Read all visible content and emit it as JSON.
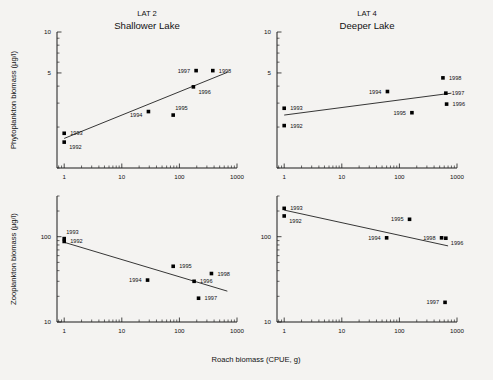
{
  "figure": {
    "background_color": "#f4f3f1",
    "ink_color": "#111111",
    "xlabel": "Roach biomass (CPUE, g)"
  },
  "chart_data": [
    {
      "type": "scatter",
      "panel_id": "top-left",
      "title": "LAT 2",
      "subtitle": "Shallower Lake",
      "xlabel": "Roach biomass (CPUE, g)",
      "ylabel": "Phytoplankton biomass (µg/l)",
      "xscale": "log",
      "yscale": "log",
      "xlim": [
        0.75,
        1000
      ],
      "ylim": [
        1.0,
        10
      ],
      "xticks": [
        1,
        10,
        100,
        1000
      ],
      "xticklabels": [
        "1",
        "10",
        "100",
        "1000"
      ],
      "yticks": [
        5,
        10
      ],
      "yticklabels": [
        "5",
        "10"
      ],
      "grid": false,
      "legend": "none",
      "points": [
        {
          "label": "1992",
          "x": 1.0,
          "y": 1.55,
          "label_pos": "below-right"
        },
        {
          "label": "1993",
          "x": 1.0,
          "y": 1.8,
          "label_pos": "right"
        },
        {
          "label": "1994",
          "x": 29,
          "y": 2.6,
          "label_pos": "left-below"
        },
        {
          "label": "1995",
          "x": 78,
          "y": 2.45,
          "label_pos": "above-right"
        },
        {
          "label": "1996",
          "x": 175,
          "y": 3.95,
          "label_pos": "below-right"
        },
        {
          "label": "1997",
          "x": 195,
          "y": 5.2,
          "label_pos": "left"
        },
        {
          "label": "1998",
          "x": 380,
          "y": 5.2,
          "label_pos": "right"
        }
      ],
      "trendline": {
        "x1": 1.0,
        "y1": 1.65,
        "x2": 680,
        "y2": 5.05,
        "slope_sign": "positive"
      }
    },
    {
      "type": "scatter",
      "panel_id": "top-right",
      "title": "LAT 4",
      "subtitle": "Deeper Lake",
      "xlabel": "Roach biomass (CPUE, g)",
      "ylabel": "Phytoplankton biomass (µg/l)",
      "xscale": "log",
      "yscale": "log",
      "xlim": [
        0.75,
        1000
      ],
      "ylim": [
        1.0,
        10
      ],
      "xticks": [
        1,
        10,
        100,
        1000
      ],
      "xticklabels": [
        "1",
        "10",
        "100",
        "1000"
      ],
      "yticks": [
        5,
        10
      ],
      "yticklabels": [
        "5",
        "10"
      ],
      "grid": false,
      "legend": "none",
      "points": [
        {
          "label": "1992",
          "x": 1.0,
          "y": 2.05,
          "label_pos": "right"
        },
        {
          "label": "1993",
          "x": 1.0,
          "y": 2.75,
          "label_pos": "right"
        },
        {
          "label": "1994",
          "x": 62,
          "y": 3.65,
          "label_pos": "left"
        },
        {
          "label": "1995",
          "x": 165,
          "y": 2.55,
          "label_pos": "left"
        },
        {
          "label": "1996",
          "x": 660,
          "y": 2.95,
          "label_pos": "right"
        },
        {
          "label": "1997",
          "x": 640,
          "y": 3.55,
          "label_pos": "right"
        },
        {
          "label": "1998",
          "x": 570,
          "y": 4.6,
          "label_pos": "right"
        }
      ],
      "trendline": {
        "x1": 1.0,
        "y1": 2.45,
        "x2": 800,
        "y2": 3.55,
        "slope_sign": "positive"
      }
    },
    {
      "type": "scatter",
      "panel_id": "bottom-left",
      "title": "LAT 2",
      "subtitle": "Shallower Lake",
      "xlabel": "Roach biomass (CPUE, g)",
      "ylabel": "Zooplankton biomass  (µg/l)",
      "xscale": "log",
      "yscale": "log",
      "xlim": [
        0.75,
        1000
      ],
      "ylim": [
        10,
        300
      ],
      "xticks": [
        1,
        10,
        100,
        1000
      ],
      "xticklabels": [
        "1",
        "10",
        "100",
        "1000"
      ],
      "yticks": [
        10,
        100
      ],
      "yticklabels": [
        "10",
        "100"
      ],
      "grid": false,
      "legend": "none",
      "points": [
        {
          "label": "1992",
          "x": 1.0,
          "y": 88,
          "label_pos": "right"
        },
        {
          "label": "1993",
          "x": 1.0,
          "y": 95,
          "label_pos": "above-right"
        },
        {
          "label": "1994",
          "x": 28,
          "y": 31,
          "label_pos": "left"
        },
        {
          "label": "1995",
          "x": 78,
          "y": 45,
          "label_pos": "right"
        },
        {
          "label": "1996",
          "x": 180,
          "y": 30,
          "label_pos": "right"
        },
        {
          "label": "1997",
          "x": 215,
          "y": 19,
          "label_pos": "right"
        },
        {
          "label": "1998",
          "x": 360,
          "y": 37,
          "label_pos": "right"
        }
      ],
      "trendline": {
        "x1": 1.0,
        "y1": 86,
        "x2": 680,
        "y2": 23,
        "slope_sign": "negative"
      }
    },
    {
      "type": "scatter",
      "panel_id": "bottom-right",
      "title": "LAT 4",
      "subtitle": "Deeper Lake",
      "xlabel": "Roach biomass (CPUE, g)",
      "ylabel": "Zooplankton biomass  (µg/l)",
      "xscale": "log",
      "yscale": "log",
      "xlim": [
        0.75,
        1000
      ],
      "ylim": [
        10,
        300
      ],
      "xticks": [
        1,
        10,
        100,
        1000
      ],
      "xticklabels": [
        "1",
        "10",
        "100",
        "1000"
      ],
      "yticks": [
        10,
        100
      ],
      "yticklabels": [
        "10",
        "100"
      ],
      "grid": false,
      "legend": "none",
      "points": [
        {
          "label": "1992",
          "x": 1.0,
          "y": 175,
          "label_pos": "below-right"
        },
        {
          "label": "1993",
          "x": 1.0,
          "y": 215,
          "label_pos": "right"
        },
        {
          "label": "1994",
          "x": 60,
          "y": 97,
          "label_pos": "left"
        },
        {
          "label": "1995",
          "x": 150,
          "y": 160,
          "label_pos": "left"
        },
        {
          "label": "1996",
          "x": 640,
          "y": 96,
          "label_pos": "below-right"
        },
        {
          "label": "1997",
          "x": 620,
          "y": 17,
          "label_pos": "left"
        },
        {
          "label": "1998",
          "x": 540,
          "y": 97,
          "label_pos": "left"
        }
      ],
      "trendline": {
        "x1": 1.0,
        "y1": 205,
        "x2": 700,
        "y2": 78,
        "slope_sign": "negative"
      }
    }
  ]
}
